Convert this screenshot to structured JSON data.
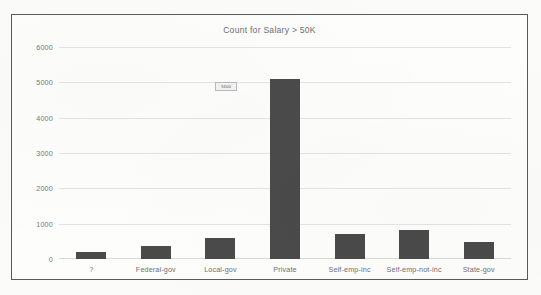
{
  "chart_data": {
    "type": "bar",
    "title": "Count for Salary > 50K",
    "xlabel": "",
    "ylabel": "",
    "categories": [
      "?",
      "Federal-gov",
      "Local-gov",
      "Private",
      "Self-emp-inc",
      "Self-emp-not-inc",
      "State-gov"
    ],
    "values": [
      200,
      370,
      600,
      5100,
      700,
      820,
      480
    ],
    "ylim": [
      0,
      6000
    ],
    "yticks": [
      0,
      1000,
      2000,
      3000,
      4000,
      5000,
      6000
    ],
    "ytick_labels": [
      "0",
      "1000",
      "2000",
      "3000",
      "4000",
      "5000",
      "6000"
    ],
    "grid": true,
    "legend": false,
    "bar_color": "#4a4a4a",
    "gridline_color": "#e3e3e5",
    "title_color": "#6e6e72",
    "tick_label_color": "#6e6e72"
  },
  "annotations": {
    "tooltip": {
      "text": "5100",
      "near_category": "Private"
    }
  },
  "watermark": {
    "line1": "",
    "line2": ""
  }
}
